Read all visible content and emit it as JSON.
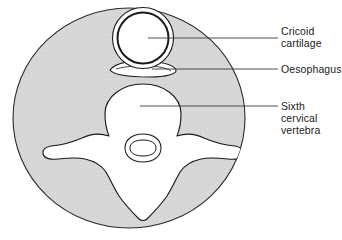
{
  "figure": {
    "type": "anatomical-cross-section",
    "background_color": "#ffffff",
    "section_fill": "#d8d8d8",
    "structure_fill": "#ffffff",
    "outline_color": "#1a1a1a",
    "leader_color": "#3a3a3a"
  },
  "labels": [
    {
      "id": "cricoid",
      "name": "cricoid-cartilage",
      "lines": [
        "Cricoid",
        "cartilage"
      ],
      "leader": {
        "x1": 148,
        "y1": 38,
        "x2": 278,
        "y2": 38
      }
    },
    {
      "id": "oesophagus",
      "name": "oesophagus",
      "lines": [
        "Oesophagus"
      ],
      "leader": {
        "x1": 152,
        "y1": 69,
        "x2": 278,
        "y2": 69
      }
    },
    {
      "id": "vertebra",
      "name": "sixth-cervical-vertebra",
      "lines": [
        "Sixth",
        "cervical",
        "vertebra"
      ],
      "leader": {
        "x1": 140,
        "y1": 106,
        "x2": 278,
        "y2": 106
      }
    }
  ],
  "structures": {
    "neck_section": {
      "cx": 129,
      "cy": 118,
      "rx": 116,
      "ry": 110
    },
    "cricoid_cartilage": {
      "cx": 143,
      "cy": 38,
      "r_outer": 31,
      "r_inner": 25
    },
    "oesophagus": {
      "cx": 143,
      "cy": 69,
      "rx": 33,
      "ry": 7
    },
    "vertebral_body": {
      "cx": 143,
      "cy": 112,
      "rx": 38,
      "ry": 28
    },
    "spinal_canal": {
      "cx": 143,
      "cy": 148,
      "rx": 18,
      "ry": 13
    },
    "transverse_process_left_tip_x": 43,
    "transverse_process_right_tip_x": 243,
    "spinous_process_tip_y": 216
  }
}
